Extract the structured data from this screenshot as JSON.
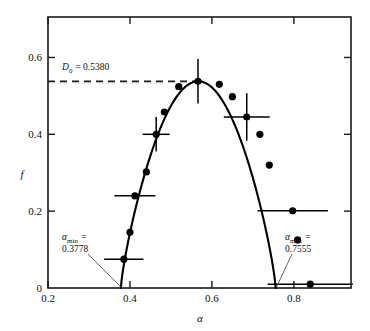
{
  "chart_data": {
    "type": "scatter",
    "title": "",
    "xlabel": "α",
    "ylabel": "f",
    "xlim": [
      0.2,
      0.9394
    ],
    "ylim": [
      0.0,
      0.7053
    ],
    "xticks": [
      0.2,
      0.4,
      0.6,
      0.8
    ],
    "xtick_labels": [
      "0.2",
      "0.4",
      "0.6",
      "0.8"
    ],
    "yticks": [
      0.0,
      0.2,
      0.4,
      0.6
    ],
    "ytick_labels": [
      "0",
      "0.2",
      "0.4",
      "0.6"
    ],
    "grid": false,
    "legend": "none",
    "series": [
      {
        "name": "data points",
        "marker": "filled-circle",
        "points": [
          {
            "x": 0.385,
            "y": 0.075,
            "xerr": 0.048,
            "yerr": 0.0
          },
          {
            "x": 0.4,
            "y": 0.145,
            "xerr": 0.0,
            "yerr": 0.0
          },
          {
            "x": 0.412,
            "y": 0.24,
            "xerr": 0.05,
            "yerr": 0.0
          },
          {
            "x": 0.44,
            "y": 0.302,
            "xerr": 0.0,
            "yerr": 0.0
          },
          {
            "x": 0.464,
            "y": 0.4,
            "xerr": 0.033,
            "yerr": 0.045
          },
          {
            "x": 0.484,
            "y": 0.458,
            "xerr": 0.0,
            "yerr": 0.0
          },
          {
            "x": 0.519,
            "y": 0.524,
            "xerr": 0.0,
            "yerr": 0.0
          },
          {
            "x": 0.566,
            "y": 0.538,
            "xerr": 0.01,
            "yerr": 0.058
          },
          {
            "x": 0.618,
            "y": 0.53,
            "xerr": 0.0,
            "yerr": 0.0
          },
          {
            "x": 0.65,
            "y": 0.498,
            "xerr": 0.0,
            "yerr": 0.0
          },
          {
            "x": 0.685,
            "y": 0.445,
            "xerr": 0.056,
            "yerr": 0.062
          },
          {
            "x": 0.717,
            "y": 0.4,
            "xerr": 0.0,
            "yerr": 0.0
          },
          {
            "x": 0.74,
            "y": 0.32,
            "xerr": 0.0,
            "yerr": 0.0
          },
          {
            "x": 0.797,
            "y": 0.201,
            "xerr": 0.086,
            "yerr": 0.0
          },
          {
            "x": 0.809,
            "y": 0.125,
            "xerr": 0.0,
            "yerr": 0.0
          },
          {
            "x": 0.84,
            "y": 0.01,
            "xerr": 0.104,
            "yerr": 0.0
          }
        ]
      },
      {
        "name": "fitted f(alpha) curve",
        "type": "line",
        "alpha_min": 0.3778,
        "alpha_max": 0.7555,
        "f_peak": 0.538,
        "alpha_peak": 0.5667
      }
    ],
    "reference_lines": [
      {
        "name": "D0-dashed",
        "orientation": "horizontal",
        "value": 0.538,
        "style": "dashed",
        "x_from": 0.2,
        "x_to": 0.5667
      }
    ],
    "annotations": [
      {
        "name": "d0-label",
        "text": "D₀ = 0.5380",
        "x": 0.255,
        "y": 0.592
      },
      {
        "name": "alpha-min-label",
        "text": "αmin = 0.3778",
        "x": 0.255,
        "y": 0.107
      },
      {
        "name": "alpha-max-label",
        "text": "αmax = 0.7555",
        "x": 0.79,
        "y": 0.107
      }
    ]
  },
  "labels": {
    "d0_symbol": "D",
    "d0_subscript": "0",
    "d0_value": "= 0.5380",
    "alpha_symbol": "α",
    "min_subscript": "min",
    "max_subscript": "max",
    "equals": "=",
    "alpha_min_value": "0.3778",
    "alpha_max_value": "0.7555",
    "x_axis_title": "α",
    "y_axis_title": "f"
  },
  "colors": {
    "axis": "#1a1a1a",
    "curve": "#000000",
    "marker": "#000000",
    "background": "#ffffff"
  }
}
